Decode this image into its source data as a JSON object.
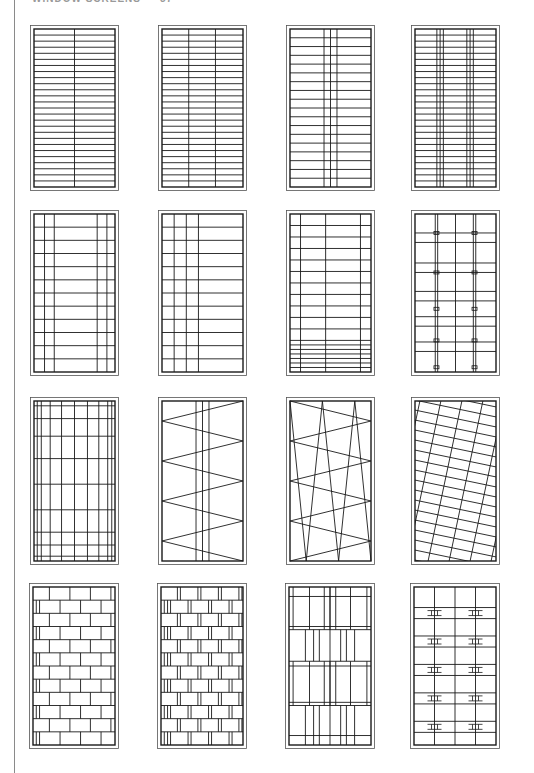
{
  "header": {
    "title": "WINDOW SCREENS",
    "page_number": "57"
  },
  "colors": {
    "line": "#1a1a1a",
    "frame": "#555555",
    "margin": "#8a8a8a"
  },
  "panels": [
    {
      "row": 1,
      "col": 1,
      "x": 30,
      "y": 25,
      "w": 89,
      "h": 166,
      "pattern": "horizontal-bars-one-mullion",
      "rows": 26,
      "vlines": [
        0.5
      ]
    },
    {
      "row": 1,
      "col": 2,
      "x": 158,
      "y": 25,
      "w": 89,
      "h": 166,
      "pattern": "horizontal-bars-two-mullions",
      "rows": 26,
      "vlines": [
        0.33,
        0.66
      ]
    },
    {
      "row": 1,
      "col": 3,
      "x": 286,
      "y": 25,
      "w": 89,
      "h": 166,
      "pattern": "horizontal-bars-center-triple",
      "rows": 18,
      "vlines": [
        0.42,
        0.5,
        0.58
      ]
    },
    {
      "row": 1,
      "col": 4,
      "x": 411,
      "y": 25,
      "w": 89,
      "h": 166,
      "pattern": "horizontal-bars-paired-triples",
      "rows": 26,
      "vlines": [
        0.27,
        0.31,
        0.35,
        0.64,
        0.68,
        0.72
      ]
    },
    {
      "row": 2,
      "col": 1,
      "x": 30,
      "y": 210,
      "w": 89,
      "h": 166,
      "pattern": "margin-bars-both-sides",
      "rows": 12,
      "vlines": [
        0.13,
        0.25,
        0.78,
        0.9
      ]
    },
    {
      "row": 2,
      "col": 2,
      "x": 158,
      "y": 210,
      "w": 89,
      "h": 166,
      "pattern": "margin-bars-left-side",
      "rows": 12,
      "vlines": [
        0.15,
        0.3,
        0.45
      ]
    },
    {
      "row": 2,
      "col": 3,
      "x": 286,
      "y": 210,
      "w": 89,
      "h": 166,
      "pattern": "bars-dense-bottom",
      "rows": 11,
      "bottom_dense": 7,
      "vlines": [
        0.13,
        0.44,
        0.87
      ]
    },
    {
      "row": 2,
      "col": 4,
      "x": 411,
      "y": 210,
      "w": 89,
      "h": 166,
      "pattern": "paired-bars-with-clips",
      "pairs": [
        0.22,
        0.33,
        0.53,
        0.6,
        0.73
      ],
      "vlines": [
        0.25,
        0.28,
        0.5,
        0.72,
        0.75
      ]
    },
    {
      "row": 3,
      "col": 1,
      "x": 30,
      "y": 397,
      "w": 89,
      "h": 168,
      "pattern": "graded-grid",
      "hlines": [
        0.03,
        0.11,
        0.22,
        0.36,
        0.52,
        0.68,
        0.82,
        0.9,
        0.97
      ],
      "vlines": [
        0.04,
        0.09,
        0.2,
        0.34,
        0.5,
        0.66,
        0.8,
        0.91,
        0.96
      ]
    },
    {
      "row": 3,
      "col": 2,
      "x": 158,
      "y": 397,
      "w": 89,
      "h": 168,
      "pattern": "zigzag-with-triple-mullion",
      "zig": 8,
      "vlines": [
        0.42,
        0.5,
        0.58
      ]
    },
    {
      "row": 3,
      "col": 3,
      "x": 286,
      "y": 397,
      "w": 89,
      "h": 168,
      "pattern": "double-zigzag",
      "zig": 8
    },
    {
      "row": 3,
      "col": 4,
      "x": 411,
      "y": 397,
      "w": 89,
      "h": 168,
      "pattern": "skewed-grid"
    },
    {
      "row": 4,
      "col": 1,
      "x": 29,
      "y": 583,
      "w": 90,
      "h": 166,
      "pattern": "staggered-brick",
      "rows": 12
    },
    {
      "row": 4,
      "col": 2,
      "x": 157,
      "y": 583,
      "w": 90,
      "h": 166,
      "pattern": "staggered-brick-double",
      "rows": 12
    },
    {
      "row": 4,
      "col": 3,
      "x": 285,
      "y": 583,
      "w": 90,
      "h": 166,
      "pattern": "banded-mullions"
    },
    {
      "row": 4,
      "col": 4,
      "x": 410,
      "y": 583,
      "w": 90,
      "h": 166,
      "pattern": "bars-with-h-clips",
      "clips": 5
    }
  ]
}
